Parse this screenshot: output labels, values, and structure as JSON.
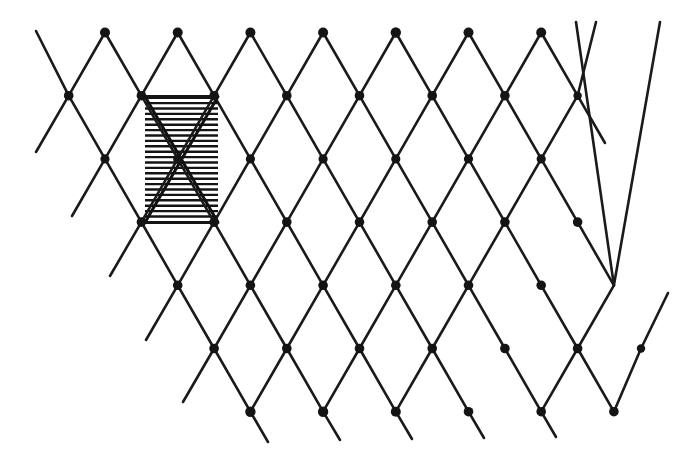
{
  "figure": {
    "kind": "lattice-diagram",
    "background_color": "#ffffff",
    "ink_color": "#1a1a1a",
    "canvas": {
      "width": 681,
      "height": 449
    }
  },
  "chart_data": {
    "type": "scatter",
    "xlabel": "",
    "ylabel": "",
    "grid": false,
    "legend": null,
    "xlim": [
      0,
      681
    ],
    "ylim": [
      0,
      449
    ],
    "lattice": {
      "column_spacing": 72.7,
      "row_spacing": 63.2,
      "row_offset": 36.35,
      "columns_x": [
        105,
        177.7,
        250.4,
        323.1,
        395.8,
        468.5,
        541.2,
        613.9
      ],
      "rows_y": [
        32.5,
        95.7,
        158.9,
        222.1,
        285.3,
        348.5,
        411.7
      ],
      "node_radius": 4.6,
      "edge_width": 2.6
    },
    "nodes": [
      {
        "x": 105.0,
        "y": 32.5,
        "r": 5.0
      },
      {
        "x": 177.7,
        "y": 32.5,
        "r": 5.0
      },
      {
        "x": 250.4,
        "y": 32.5,
        "r": 5.0
      },
      {
        "x": 323.1,
        "y": 32.5,
        "r": 5.0
      },
      {
        "x": 395.8,
        "y": 32.5,
        "r": 5.2
      },
      {
        "x": 468.5,
        "y": 32.5,
        "r": 5.0
      },
      {
        "x": 541.2,
        "y": 32.5,
        "r": 5.0
      },
      {
        "x": 68.7,
        "y": 95.7,
        "r": 4.8
      },
      {
        "x": 141.4,
        "y": 95.7,
        "r": 4.8
      },
      {
        "x": 214.1,
        "y": 95.7,
        "r": 4.8
      },
      {
        "x": 286.8,
        "y": 95.7,
        "r": 4.8
      },
      {
        "x": 359.5,
        "y": 95.7,
        "r": 4.8
      },
      {
        "x": 432.2,
        "y": 95.7,
        "r": 4.8
      },
      {
        "x": 504.9,
        "y": 95.7,
        "r": 4.8
      },
      {
        "x": 577.6,
        "y": 95.7,
        "r": 4.2
      },
      {
        "x": 105.0,
        "y": 158.9,
        "r": 4.6
      },
      {
        "x": 177.7,
        "y": 158.9,
        "r": 4.6
      },
      {
        "x": 250.4,
        "y": 158.9,
        "r": 4.6
      },
      {
        "x": 323.1,
        "y": 158.9,
        "r": 4.6
      },
      {
        "x": 395.8,
        "y": 158.9,
        "r": 4.6
      },
      {
        "x": 468.5,
        "y": 158.9,
        "r": 4.6
      },
      {
        "x": 541.2,
        "y": 158.9,
        "r": 4.6
      },
      {
        "x": 141.4,
        "y": 222.1,
        "r": 4.8
      },
      {
        "x": 214.1,
        "y": 222.1,
        "r": 4.8
      },
      {
        "x": 286.8,
        "y": 222.1,
        "r": 4.8
      },
      {
        "x": 359.5,
        "y": 222.1,
        "r": 4.8
      },
      {
        "x": 432.2,
        "y": 222.1,
        "r": 4.8
      },
      {
        "x": 504.9,
        "y": 222.1,
        "r": 4.8
      },
      {
        "x": 577.6,
        "y": 222.1,
        "r": 4.8
      },
      {
        "x": 177.7,
        "y": 285.3,
        "r": 4.8
      },
      {
        "x": 250.4,
        "y": 285.3,
        "r": 4.8
      },
      {
        "x": 323.1,
        "y": 285.3,
        "r": 4.8
      },
      {
        "x": 395.8,
        "y": 285.3,
        "r": 4.8
      },
      {
        "x": 468.5,
        "y": 285.3,
        "r": 4.8
      },
      {
        "x": 541.2,
        "y": 285.3,
        "r": 4.8
      },
      {
        "x": 214.1,
        "y": 348.5,
        "r": 4.8
      },
      {
        "x": 286.8,
        "y": 348.5,
        "r": 4.8
      },
      {
        "x": 359.5,
        "y": 348.5,
        "r": 4.8
      },
      {
        "x": 432.2,
        "y": 348.5,
        "r": 4.8
      },
      {
        "x": 504.9,
        "y": 348.5,
        "r": 4.8
      },
      {
        "x": 577.6,
        "y": 348.5,
        "r": 4.8
      },
      {
        "x": 641.0,
        "y": 348.5,
        "r": 4.2
      },
      {
        "x": 250.4,
        "y": 411.7,
        "r": 5.2
      },
      {
        "x": 323.1,
        "y": 411.7,
        "r": 5.2
      },
      {
        "x": 395.8,
        "y": 411.7,
        "r": 5.0
      },
      {
        "x": 468.5,
        "y": 411.7,
        "r": 4.8
      },
      {
        "x": 541.2,
        "y": 411.7,
        "r": 4.8
      },
      {
        "x": 613.9,
        "y": 411.7,
        "r": 4.8
      }
    ],
    "edges_down_right": [
      {
        "x1": 36.0,
        "y1": 31.0,
        "x2": 68.7,
        "y2": 95.7
      },
      {
        "x1": 68.7,
        "y1": 95.7,
        "x2": 105.0,
        "y2": 158.9
      },
      {
        "x1": 105.0,
        "y1": 158.9,
        "x2": 141.4,
        "y2": 222.1
      },
      {
        "x1": 141.4,
        "y1": 222.1,
        "x2": 177.7,
        "y2": 285.3
      },
      {
        "x1": 177.7,
        "y1": 285.3,
        "x2": 214.1,
        "y2": 348.5
      },
      {
        "x1": 214.1,
        "y1": 348.5,
        "x2": 250.4,
        "y2": 411.7
      },
      {
        "x1": 250.4,
        "y1": 411.7,
        "x2": 268.0,
        "y2": 442.0
      },
      {
        "x1": 105.0,
        "y1": 32.5,
        "x2": 141.4,
        "y2": 95.7
      },
      {
        "x1": 141.4,
        "y1": 95.7,
        "x2": 177.7,
        "y2": 158.9
      },
      {
        "x1": 177.7,
        "y1": 158.9,
        "x2": 214.1,
        "y2": 222.1
      },
      {
        "x1": 214.1,
        "y1": 222.1,
        "x2": 250.4,
        "y2": 285.3
      },
      {
        "x1": 250.4,
        "y1": 285.3,
        "x2": 286.8,
        "y2": 348.5
      },
      {
        "x1": 286.8,
        "y1": 348.5,
        "x2": 323.1,
        "y2": 411.7
      },
      {
        "x1": 323.1,
        "y1": 411.7,
        "x2": 340.0,
        "y2": 440.0
      },
      {
        "x1": 177.7,
        "y1": 32.5,
        "x2": 214.1,
        "y2": 95.7
      },
      {
        "x1": 214.1,
        "y1": 95.7,
        "x2": 250.4,
        "y2": 158.9
      },
      {
        "x1": 250.4,
        "y1": 158.9,
        "x2": 286.8,
        "y2": 222.1
      },
      {
        "x1": 286.8,
        "y1": 222.1,
        "x2": 323.1,
        "y2": 285.3
      },
      {
        "x1": 323.1,
        "y1": 285.3,
        "x2": 359.5,
        "y2": 348.5
      },
      {
        "x1": 359.5,
        "y1": 348.5,
        "x2": 395.8,
        "y2": 411.7
      },
      {
        "x1": 395.8,
        "y1": 411.7,
        "x2": 412.0,
        "y2": 439.0
      },
      {
        "x1": 250.4,
        "y1": 32.5,
        "x2": 286.8,
        "y2": 95.7
      },
      {
        "x1": 286.8,
        "y1": 95.7,
        "x2": 323.1,
        "y2": 158.9
      },
      {
        "x1": 323.1,
        "y1": 158.9,
        "x2": 359.5,
        "y2": 222.1
      },
      {
        "x1": 359.5,
        "y1": 222.1,
        "x2": 395.8,
        "y2": 285.3
      },
      {
        "x1": 395.8,
        "y1": 285.3,
        "x2": 432.2,
        "y2": 348.5
      },
      {
        "x1": 432.2,
        "y1": 348.5,
        "x2": 468.5,
        "y2": 411.7
      },
      {
        "x1": 468.5,
        "y1": 411.7,
        "x2": 484.0,
        "y2": 438.0
      },
      {
        "x1": 323.1,
        "y1": 32.5,
        "x2": 359.5,
        "y2": 95.7
      },
      {
        "x1": 359.5,
        "y1": 95.7,
        "x2": 395.8,
        "y2": 158.9
      },
      {
        "x1": 395.8,
        "y1": 158.9,
        "x2": 432.2,
        "y2": 222.1
      },
      {
        "x1": 432.2,
        "y1": 222.1,
        "x2": 468.5,
        "y2": 285.3
      },
      {
        "x1": 468.5,
        "y1": 285.3,
        "x2": 504.9,
        "y2": 348.5
      },
      {
        "x1": 504.9,
        "y1": 348.5,
        "x2": 541.2,
        "y2": 411.7
      },
      {
        "x1": 541.2,
        "y1": 411.7,
        "x2": 556.0,
        "y2": 437.0
      },
      {
        "x1": 395.8,
        "y1": 32.5,
        "x2": 432.2,
        "y2": 95.7
      },
      {
        "x1": 432.2,
        "y1": 95.7,
        "x2": 468.5,
        "y2": 158.9
      },
      {
        "x1": 468.5,
        "y1": 158.9,
        "x2": 504.9,
        "y2": 222.1
      },
      {
        "x1": 504.9,
        "y1": 222.1,
        "x2": 541.2,
        "y2": 285.3
      },
      {
        "x1": 541.2,
        "y1": 285.3,
        "x2": 577.6,
        "y2": 348.5
      },
      {
        "x1": 577.6,
        "y1": 348.5,
        "x2": 613.9,
        "y2": 411.7
      },
      {
        "x1": 468.5,
        "y1": 32.5,
        "x2": 504.9,
        "y2": 95.7
      },
      {
        "x1": 504.9,
        "y1": 95.7,
        "x2": 541.2,
        "y2": 158.9
      },
      {
        "x1": 541.2,
        "y1": 158.9,
        "x2": 577.6,
        "y2": 222.1
      },
      {
        "x1": 577.6,
        "y1": 222.1,
        "x2": 613.9,
        "y2": 285.3
      },
      {
        "x1": 541.2,
        "y1": 32.5,
        "x2": 577.6,
        "y2": 95.7
      },
      {
        "x1": 577.6,
        "y1": 95.7,
        "x2": 605.0,
        "y2": 143.0
      },
      {
        "x1": 576.0,
        "y1": 22.0,
        "x2": 613.9,
        "y2": 285.3
      },
      {
        "x1": 641.0,
        "y1": 348.5,
        "x2": 641.0,
        "y2": 348.5
      }
    ],
    "edges_down_left": [
      {
        "x1": 105.0,
        "y1": 32.5,
        "x2": 68.7,
        "y2": 95.7
      },
      {
        "x1": 68.7,
        "y1": 95.7,
        "x2": 36.0,
        "y2": 152.0
      },
      {
        "x1": 177.7,
        "y1": 32.5,
        "x2": 141.4,
        "y2": 95.7
      },
      {
        "x1": 141.4,
        "y1": 95.7,
        "x2": 105.0,
        "y2": 158.9
      },
      {
        "x1": 105.0,
        "y1": 158.9,
        "x2": 72.0,
        "y2": 216.0
      },
      {
        "x1": 250.4,
        "y1": 32.5,
        "x2": 214.1,
        "y2": 95.7
      },
      {
        "x1": 214.1,
        "y1": 95.7,
        "x2": 177.7,
        "y2": 158.9
      },
      {
        "x1": 177.7,
        "y1": 158.9,
        "x2": 141.4,
        "y2": 222.1
      },
      {
        "x1": 141.4,
        "y1": 222.1,
        "x2": 110.0,
        "y2": 276.0
      },
      {
        "x1": 323.1,
        "y1": 32.5,
        "x2": 286.8,
        "y2": 95.7
      },
      {
        "x1": 286.8,
        "y1": 95.7,
        "x2": 250.4,
        "y2": 158.9
      },
      {
        "x1": 250.4,
        "y1": 158.9,
        "x2": 214.1,
        "y2": 222.1
      },
      {
        "x1": 214.1,
        "y1": 222.1,
        "x2": 177.7,
        "y2": 285.3
      },
      {
        "x1": 177.7,
        "y1": 285.3,
        "x2": 146.0,
        "y2": 340.0
      },
      {
        "x1": 395.8,
        "y1": 32.5,
        "x2": 359.5,
        "y2": 95.7
      },
      {
        "x1": 359.5,
        "y1": 95.7,
        "x2": 323.1,
        "y2": 158.9
      },
      {
        "x1": 323.1,
        "y1": 158.9,
        "x2": 286.8,
        "y2": 222.1
      },
      {
        "x1": 286.8,
        "y1": 222.1,
        "x2": 250.4,
        "y2": 285.3
      },
      {
        "x1": 250.4,
        "y1": 285.3,
        "x2": 214.1,
        "y2": 348.5
      },
      {
        "x1": 214.1,
        "y1": 348.5,
        "x2": 183.0,
        "y2": 402.0
      },
      {
        "x1": 468.5,
        "y1": 32.5,
        "x2": 432.2,
        "y2": 95.7
      },
      {
        "x1": 432.2,
        "y1": 95.7,
        "x2": 395.8,
        "y2": 158.9
      },
      {
        "x1": 395.8,
        "y1": 158.9,
        "x2": 359.5,
        "y2": 222.1
      },
      {
        "x1": 359.5,
        "y1": 222.1,
        "x2": 323.1,
        "y2": 285.3
      },
      {
        "x1": 323.1,
        "y1": 285.3,
        "x2": 286.8,
        "y2": 348.5
      },
      {
        "x1": 286.8,
        "y1": 348.5,
        "x2": 250.4,
        "y2": 411.7
      },
      {
        "x1": 541.2,
        "y1": 32.5,
        "x2": 504.9,
        "y2": 95.7
      },
      {
        "x1": 504.9,
        "y1": 95.7,
        "x2": 468.5,
        "y2": 158.9
      },
      {
        "x1": 468.5,
        "y1": 158.9,
        "x2": 432.2,
        "y2": 222.1
      },
      {
        "x1": 432.2,
        "y1": 222.1,
        "x2": 395.8,
        "y2": 285.3
      },
      {
        "x1": 395.8,
        "y1": 285.3,
        "x2": 359.5,
        "y2": 348.5
      },
      {
        "x1": 359.5,
        "y1": 348.5,
        "x2": 323.1,
        "y2": 411.7
      },
      {
        "x1": 596.0,
        "y1": 22.0,
        "x2": 577.6,
        "y2": 95.7
      },
      {
        "x1": 577.6,
        "y1": 95.7,
        "x2": 541.2,
        "y2": 158.9
      },
      {
        "x1": 541.2,
        "y1": 158.9,
        "x2": 504.9,
        "y2": 222.1
      },
      {
        "x1": 504.9,
        "y1": 222.1,
        "x2": 468.5,
        "y2": 285.3
      },
      {
        "x1": 468.5,
        "y1": 285.3,
        "x2": 432.2,
        "y2": 348.5
      },
      {
        "x1": 432.2,
        "y1": 348.5,
        "x2": 395.8,
        "y2": 411.7
      },
      {
        "x1": 660.0,
        "y1": 22.0,
        "x2": 613.9,
        "y2": 285.3
      },
      {
        "x1": 613.9,
        "y1": 285.3,
        "x2": 577.6,
        "y2": 348.5
      },
      {
        "x1": 577.6,
        "y1": 348.5,
        "x2": 541.2,
        "y2": 411.7
      },
      {
        "x1": 668.0,
        "y1": 293.0,
        "x2": 641.0,
        "y2": 348.5
      },
      {
        "x1": 641.0,
        "y1": 348.5,
        "x2": 613.9,
        "y2": 411.7
      }
    ],
    "unit_cell": {
      "label": "hatched unit cell",
      "x": 145.0,
      "y": 96.5,
      "width": 73.0,
      "height": 126.0,
      "hatch_line_count": 23,
      "hatch_spacing": 5.4,
      "hatch_color": "#141414",
      "hatch_orientation": "horizontal",
      "diagonals": [
        {
          "x1": 145.0,
          "y1": 96.5,
          "x2": 218.0,
          "y2": 222.5
        },
        {
          "x1": 218.0,
          "y1": 96.5,
          "x2": 145.0,
          "y2": 222.5
        }
      ],
      "corner_nodes": [
        {
          "x": 141.4,
          "y": 95.7
        },
        {
          "x": 214.1,
          "y": 95.7
        },
        {
          "x": 141.4,
          "y": 222.1
        },
        {
          "x": 214.1,
          "y": 222.1
        }
      ],
      "center_node": {
        "x": 177.7,
        "y": 158.9
      }
    }
  }
}
